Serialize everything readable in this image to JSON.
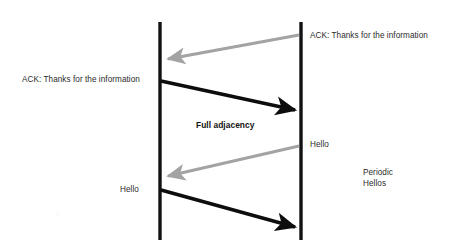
{
  "diagram": {
    "type": "sequence-diagram",
    "title_label": "Full adjacency",
    "background_color": "#ffffff",
    "lifelines": [
      {
        "name": "left-router-lifeline",
        "x": 160,
        "y_top": 22,
        "y_bottom": 240,
        "color": "#111111",
        "width": 3.4
      },
      {
        "name": "right-router-lifeline",
        "x": 301,
        "y_top": 22,
        "y_bottom": 240,
        "color": "#111111",
        "width": 3.4
      }
    ],
    "messages": [
      {
        "id": "msg-ack-right-to-left",
        "label": "ACK: Thanks for the information",
        "direction": "right-to-left",
        "color": "#a3a3a3",
        "x1": 299,
        "y1": 35,
        "x2": 164,
        "y2": 60,
        "stroke_width": 3.2
      },
      {
        "id": "msg-ack-left-to-right",
        "label": "ACK: Thanks for the information",
        "direction": "left-to-right",
        "color": "#0d0d0d",
        "x1": 162,
        "y1": 81,
        "x2": 299,
        "y2": 111,
        "stroke_width": 3.6
      },
      {
        "id": "msg-hello-right-to-left",
        "label": "Hello",
        "direction": "right-to-left",
        "color": "#a3a3a3",
        "x1": 299,
        "y1": 146,
        "x2": 164,
        "y2": 177,
        "stroke_width": 3.2
      },
      {
        "id": "msg-hello-left-to-right",
        "label": "Hello",
        "direction": "left-to-right",
        "color": "#0d0d0d",
        "x1": 162,
        "y1": 190,
        "x2": 299,
        "y2": 228,
        "stroke_width": 3.6
      }
    ],
    "annotations": {
      "ack_right": "ACK: Thanks for the information",
      "ack_left": "ACK: Thanks for the information",
      "full_adjacency": "Full adjacency",
      "hello_right": "Hello",
      "hello_left": "Hello",
      "periodic_hellos": "Periodic\nHellos"
    },
    "colors": {
      "black_arrow": "#0d0d0d",
      "gray_arrow": "#a3a3a3",
      "lifeline": "#111111",
      "text": "#2b2b2b",
      "bold_text": "#111111"
    }
  }
}
